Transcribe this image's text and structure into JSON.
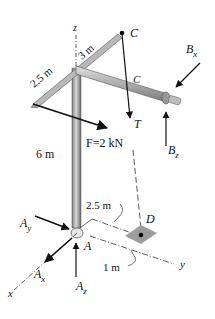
{
  "diagram": {
    "type": "3d-statics-free-body",
    "axes": {
      "x": "x",
      "y": "y",
      "z": "z"
    },
    "points": {
      "A": "A",
      "C_top": "C",
      "C_mid": "C",
      "D": "D"
    },
    "dimensions": {
      "arm_front": "2.5 m",
      "arm_back": "3 m",
      "mast_height": "6 m",
      "base_offset": "2.5 m",
      "d_offset": "1 m"
    },
    "forces": {
      "applied": "F=2 kN",
      "cable": "T",
      "bx_main": "B",
      "bx_sub": "x",
      "bz_main": "B",
      "bz_sub": "z",
      "ay_main": "A",
      "ay_sub": "y",
      "ax_main": "A",
      "ax_sub": "x",
      "az_main": "A",
      "az_sub": "z"
    },
    "colors": {
      "pipe": "#a9a9a9",
      "pipe_dark": "#6e6e6e",
      "pipe_light": "#dcdcdc",
      "plate": "#9c9c9c",
      "ink": "#111111"
    }
  }
}
